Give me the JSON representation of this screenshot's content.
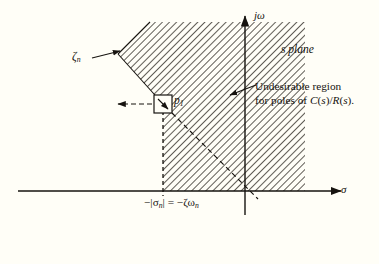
{
  "figure": {
    "background_color": "#fffef7",
    "ink_color": "#16130f"
  },
  "axes": {
    "vertical_label": "jω",
    "vertical_name": "imaginary-axis",
    "horizontal_label": "σ",
    "horizontal_name": "real-axis",
    "origin_x": 245,
    "origin_y": 191
  },
  "labels": {
    "plane": "s plane",
    "zeta": "ζ",
    "zeta_subscript": "n",
    "pole": "p",
    "pole_subscript": "1",
    "sigma_expression_prefix": "−|σ",
    "sigma_expression_suffix": "| = −ζω",
    "sigma_subscript": "n",
    "sigma_full": "−|σₙ| = −ζωₙ",
    "undesirable_line1": "Undesirable region",
    "undesirable_line2_a": "for poles of ",
    "undesirable_line2_b": "C",
    "undesirable_line2_c": "(",
    "undesirable_line2_d": "s",
    "undesirable_line2_e": ")/",
    "undesirable_line2_f": "R",
    "undesirable_line2_g": "(",
    "undesirable_line2_h": "s",
    "undesirable_line2_i": ").",
    "undesirable_full": "Undesirable region for poles of C(s)/R(s)."
  },
  "region": {
    "name": "undesirable-pole-region",
    "fill": "hatched-45deg",
    "hatch_color": "#2a2620",
    "boundary_note": "diagonal constant-damping line and vertical constant-sigma line",
    "vertices": [
      [
        118,
        54
      ],
      [
        150,
        22
      ],
      [
        305,
        22
      ],
      [
        305,
        191
      ],
      [
        163,
        191
      ],
      [
        163,
        104
      ]
    ]
  },
  "pole": {
    "name": "pole-p1",
    "x": 163,
    "y": 104,
    "marker": "square-box-with-arrow"
  },
  "annotations": {
    "zeta_leader": {
      "from": [
        92,
        57
      ],
      "to": [
        122,
        50
      ]
    },
    "undesirable_leader": {
      "from": [
        253,
        86
      ],
      "to": [
        228,
        95
      ]
    },
    "pole_leader": {
      "from": [
        152,
        104
      ],
      "to": [
        118,
        104
      ]
    }
  }
}
